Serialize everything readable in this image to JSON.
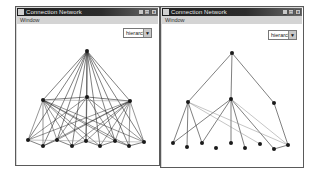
{
  "windows": [
    {
      "id": "left",
      "title": "Connection Network",
      "menu": [
        "Window"
      ],
      "title_buttons": [
        "_",
        "□",
        "×"
      ],
      "dropdown": {
        "selected": "hierarchy",
        "arrow": "▼"
      },
      "layout": "dense hierarchy (all connections)",
      "nodes": [
        {
          "id": "root",
          "x": 87,
          "y": 51
        },
        {
          "id": "m1",
          "x": 43,
          "y": 100
        },
        {
          "id": "m2",
          "x": 87,
          "y": 97
        },
        {
          "id": "m3",
          "x": 130,
          "y": 101
        },
        {
          "id": "b1",
          "x": 28,
          "y": 140
        },
        {
          "id": "b2",
          "x": 43,
          "y": 146
        },
        {
          "id": "b3",
          "x": 57,
          "y": 140
        },
        {
          "id": "b4",
          "x": 72,
          "y": 146
        },
        {
          "id": "b5",
          "x": 86,
          "y": 141
        },
        {
          "id": "b6",
          "x": 100,
          "y": 146
        },
        {
          "id": "b7",
          "x": 115,
          "y": 141
        },
        {
          "id": "b8",
          "x": 129,
          "y": 146
        },
        {
          "id": "b9",
          "x": 144,
          "y": 142
        }
      ]
    },
    {
      "id": "right",
      "title": "Connection Network",
      "menu": [
        "Window"
      ],
      "title_buttons": [
        "_",
        "□",
        "×"
      ],
      "dropdown": {
        "selected": "hierarchy",
        "arrow": "▼"
      },
      "layout": "tree hierarchy",
      "nodes": [
        {
          "id": "root",
          "x": 232,
          "y": 53
        },
        {
          "id": "m1",
          "x": 188,
          "y": 102
        },
        {
          "id": "m2",
          "x": 231,
          "y": 99
        },
        {
          "id": "m3",
          "x": 274,
          "y": 103
        },
        {
          "id": "b1",
          "x": 173,
          "y": 143
        },
        {
          "id": "b2",
          "x": 187,
          "y": 147
        },
        {
          "id": "b3",
          "x": 202,
          "y": 143
        },
        {
          "id": "b4",
          "x": 216,
          "y": 148
        },
        {
          "id": "b5",
          "x": 231,
          "y": 143
        },
        {
          "id": "b6",
          "x": 245,
          "y": 148
        },
        {
          "id": "b7",
          "x": 260,
          "y": 144
        },
        {
          "id": "b8",
          "x": 274,
          "y": 149
        },
        {
          "id": "b9",
          "x": 288,
          "y": 145
        }
      ]
    }
  ],
  "colors": {
    "node": "#1a1a1a",
    "edge_dark": "#2a2a2a",
    "edge_light": "#8a8a8a",
    "titlebar": "#222222",
    "menubar": "#d4d4d4"
  }
}
